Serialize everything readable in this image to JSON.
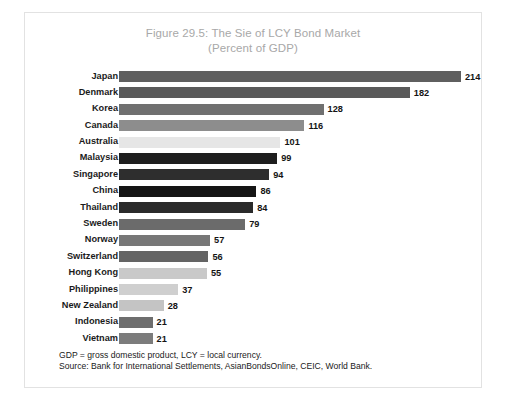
{
  "figure": {
    "title_line1": "Figure 29.5: The Sie  of LCY Bond Market",
    "title_line2": "(Percent of GDP)",
    "title_color": "#a8a8a8",
    "frame_color": "#e2e2e2",
    "background": "#ffffff"
  },
  "footnotes": {
    "note": "GDP = gross domestic product, LCY = local currency.",
    "source": "Source: Bank for International Settlements, AsianBondsOnline, CEIC, World Bank."
  },
  "chart_data": {
    "type": "bar",
    "orientation": "horizontal",
    "title": "Figure 29.5: The Sie  of LCY Bond Market (Percent of GDP)",
    "xlabel": "",
    "ylabel": "",
    "xlim": [
      0,
      214
    ],
    "grid": false,
    "legend": "none",
    "value_labels": true,
    "categories": [
      "Japan",
      "Denmark",
      "Korea",
      "Canada",
      "Australia",
      "Malaysia",
      "Singapore",
      "China",
      "Thailand",
      "Sweden",
      "Norway",
      "Switzerland",
      "Hong Kong",
      "Philippines",
      "New Zealand",
      "Indonesia",
      "Vietnam"
    ],
    "values": [
      214,
      182,
      128,
      116,
      101,
      99,
      94,
      86,
      84,
      79,
      57,
      56,
      55,
      37,
      28,
      21,
      21
    ],
    "bar_colors": [
      "#5f5f5f",
      "#5a5a5a",
      "#707070",
      "#8d8d8d",
      "#e6e6e6",
      "#1e1e1e",
      "#2e2e2e",
      "#151515",
      "#2a2a2a",
      "#6b6b6b",
      "#777777",
      "#646464",
      "#c9c9c9",
      "#cfcfcf",
      "#c4c4c4",
      "#6e6e6e",
      "#7c7c7c"
    ],
    "bars": [
      {
        "category": "Japan",
        "value": 214,
        "label": "214",
        "color": "#5f5f5f"
      },
      {
        "category": "Denmark",
        "value": 182,
        "label": "182",
        "color": "#5a5a5a"
      },
      {
        "category": "Korea",
        "value": 128,
        "label": "128",
        "color": "#707070"
      },
      {
        "category": "Canada",
        "value": 116,
        "label": "116",
        "color": "#8d8d8d"
      },
      {
        "category": "Australia",
        "value": 101,
        "label": "101",
        "color": "#e6e6e6"
      },
      {
        "category": "Malaysia",
        "value": 99,
        "label": "99",
        "color": "#1e1e1e"
      },
      {
        "category": "Singapore",
        "value": 94,
        "label": "94",
        "color": "#2e2e2e"
      },
      {
        "category": "China",
        "value": 86,
        "label": "86",
        "color": "#151515"
      },
      {
        "category": "Thailand",
        "value": 84,
        "label": "84",
        "color": "#2a2a2a"
      },
      {
        "category": "Sweden",
        "value": 79,
        "label": "79",
        "color": "#6b6b6b"
      },
      {
        "category": "Norway",
        "value": 57,
        "label": "57",
        "color": "#777777"
      },
      {
        "category": "Switzerland",
        "value": 56,
        "label": "56",
        "color": "#646464"
      },
      {
        "category": "Hong Kong",
        "value": 55,
        "label": "55",
        "color": "#c9c9c9"
      },
      {
        "category": "Philippines",
        "value": 37,
        "label": "37",
        "color": "#cfcfcf"
      },
      {
        "category": "New Zealand",
        "value": 28,
        "label": "28",
        "color": "#c4c4c4"
      },
      {
        "category": "Indonesia",
        "value": 21,
        "label": "21",
        "color": "#6e6e6e"
      },
      {
        "category": "Vietnam",
        "value": 21,
        "label": "21",
        "color": "#7c7c7c"
      }
    ]
  }
}
